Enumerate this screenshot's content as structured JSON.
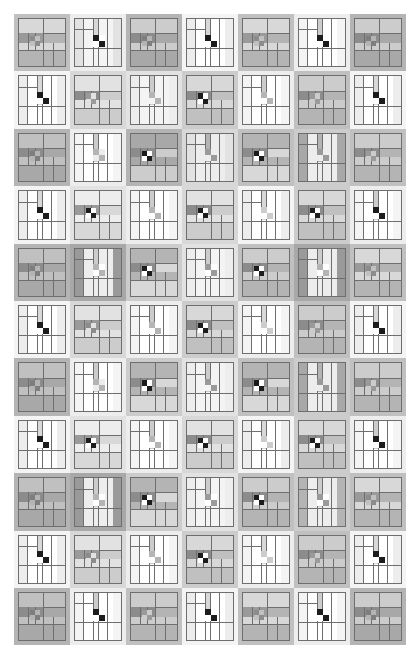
{
  "artwork": {
    "title": "Abstract Grayscale Quilt Grid",
    "description": "A rectangular grid of small abstract quilt blocks rendered in grayscale on a white background.",
    "background_color": "#ffffff",
    "grid": {
      "rows": 11,
      "columns": 7,
      "origin_x": 14,
      "origin_y": 14,
      "cell_width": 56,
      "cell_height": 57.4,
      "total_width": 392,
      "total_height": 631
    },
    "palette": {
      "white": "#ffffff",
      "near_white": "#f4f4f4",
      "light_1": "#ededed",
      "light_2": "#e2e2e2",
      "light_3": "#d8d8d8",
      "mid_1": "#cccccc",
      "mid_2": "#c0c0c0",
      "mid_3": "#b4b4b4",
      "mid_4": "#a8a8a8",
      "dark_1": "#9a9a9a",
      "dark_2": "#8c8c8c",
      "dark_3": "#7e7e7e",
      "very_dark": "#4a4a4a",
      "black": "#1c1c1c",
      "line": "#6e6e6e"
    },
    "block_types": {
      "A": "cross-bar block: horizontal banded interior with offset cross rails and a small 2x2 center",
      "B": "pinwheel block: vertical striped interior with a high-contrast 2x2 checkerboard center"
    },
    "cells": [
      {
        "r": 0,
        "c": 0,
        "type": "A",
        "bg": "#c0c0c0",
        "frame": "#d8d8d8",
        "field": "#b4b4b4",
        "accent": "#9a9a9a",
        "center": "#8c8c8c",
        "center_alt": "#c0c0c0"
      },
      {
        "r": 0,
        "c": 1,
        "type": "B",
        "bg": "#ededed",
        "frame": "#e2e2e2",
        "field": "#f4f4f4",
        "accent": "#d8d8d8",
        "center": "#1c1c1c",
        "center_alt": "#ffffff"
      },
      {
        "r": 0,
        "c": 2,
        "type": "A",
        "bg": "#b4b4b4",
        "frame": "#cccccc",
        "field": "#a8a8a8",
        "accent": "#8c8c8c",
        "center": "#7e7e7e",
        "center_alt": "#b4b4b4"
      },
      {
        "r": 0,
        "c": 3,
        "type": "B",
        "bg": "#f4f4f4",
        "frame": "#ededed",
        "field": "#ffffff",
        "accent": "#d8d8d8",
        "center": "#1c1c1c",
        "center_alt": "#ffffff"
      },
      {
        "r": 0,
        "c": 4,
        "type": "A",
        "bg": "#c0c0c0",
        "frame": "#d8d8d8",
        "field": "#b4b4b4",
        "accent": "#9a9a9a",
        "center": "#8c8c8c",
        "center_alt": "#c0c0c0"
      },
      {
        "r": 0,
        "c": 5,
        "type": "B",
        "bg": "#ededed",
        "frame": "#f4f4f4",
        "field": "#ffffff",
        "accent": "#cccccc",
        "center": "#1c1c1c",
        "center_alt": "#ffffff"
      },
      {
        "r": 0,
        "c": 6,
        "type": "A",
        "bg": "#b4b4b4",
        "frame": "#cccccc",
        "field": "#a8a8a8",
        "accent": "#8c8c8c",
        "center": "#7e7e7e",
        "center_alt": "#b4b4b4"
      },
      {
        "r": 1,
        "c": 0,
        "type": "B",
        "bg": "#f4f4f4",
        "frame": "#ededed",
        "field": "#ffffff",
        "accent": "#d8d8d8",
        "center": "#1c1c1c",
        "center_alt": "#ffffff"
      },
      {
        "r": 1,
        "c": 1,
        "type": "A",
        "bg": "#d8d8d8",
        "frame": "#e2e2e2",
        "field": "#cccccc",
        "accent": "#8c8c8c",
        "center": "#9a9a9a",
        "center_alt": "#e2e2e2"
      },
      {
        "r": 1,
        "c": 2,
        "type": "B",
        "bg": "#e2e2e2",
        "frame": "#ededed",
        "field": "#f4f4f4",
        "accent": "#cccccc",
        "center": "#b4b4b4",
        "center_alt": "#f4f4f4"
      },
      {
        "r": 1,
        "c": 3,
        "type": "A",
        "bg": "#cccccc",
        "frame": "#d8d8d8",
        "field": "#c0c0c0",
        "accent": "#8c8c8c",
        "center": "#1c1c1c",
        "center_alt": "#ffffff"
      },
      {
        "r": 1,
        "c": 4,
        "type": "B",
        "bg": "#ededed",
        "frame": "#f4f4f4",
        "field": "#ffffff",
        "accent": "#cccccc",
        "center": "#b4b4b4",
        "center_alt": "#ffffff"
      },
      {
        "r": 1,
        "c": 5,
        "type": "A",
        "bg": "#c0c0c0",
        "frame": "#cccccc",
        "field": "#b4b4b4",
        "accent": "#8c8c8c",
        "center": "#9a9a9a",
        "center_alt": "#cccccc"
      },
      {
        "r": 1,
        "c": 6,
        "type": "B",
        "bg": "#f4f4f4",
        "frame": "#ededed",
        "field": "#ffffff",
        "accent": "#d8d8d8",
        "center": "#1c1c1c",
        "center_alt": "#ffffff"
      },
      {
        "r": 2,
        "c": 0,
        "type": "A",
        "bg": "#b4b4b4",
        "frame": "#c0c0c0",
        "field": "#a8a8a8",
        "accent": "#8c8c8c",
        "center": "#7e7e7e",
        "center_alt": "#b4b4b4"
      },
      {
        "r": 2,
        "c": 1,
        "type": "B",
        "bg": "#ededed",
        "frame": "#f4f4f4",
        "field": "#ffffff",
        "accent": "#cccccc",
        "center": "#b4b4b4",
        "center_alt": "#ededed"
      },
      {
        "r": 2,
        "c": 2,
        "type": "A",
        "bg": "#b4b4b4",
        "frame": "#a8a8a8",
        "field": "#cccccc",
        "accent": "#8c8c8c",
        "center": "#1c1c1c",
        "center_alt": "#ffffff"
      },
      {
        "r": 2,
        "c": 3,
        "type": "B",
        "bg": "#d8d8d8",
        "frame": "#e2e2e2",
        "field": "#ededed",
        "accent": "#b4b4b4",
        "center": "#9a9a9a",
        "center_alt": "#ededed"
      },
      {
        "r": 2,
        "c": 4,
        "type": "A",
        "bg": "#c0c0c0",
        "frame": "#b4b4b4",
        "field": "#d8d8d8",
        "accent": "#8c8c8c",
        "center": "#1c1c1c",
        "center_alt": "#ffffff"
      },
      {
        "r": 2,
        "c": 5,
        "type": "B",
        "bg": "#cccccc",
        "frame": "#a8a8a8",
        "field": "#ededed",
        "accent": "#b4b4b4",
        "center": "#9a9a9a",
        "center_alt": "#ededed"
      },
      {
        "r": 2,
        "c": 6,
        "type": "A",
        "bg": "#c0c0c0",
        "frame": "#cccccc",
        "field": "#b4b4b4",
        "accent": "#8c8c8c",
        "center": "#9a9a9a",
        "center_alt": "#cccccc"
      },
      {
        "r": 3,
        "c": 0,
        "type": "B",
        "bg": "#f4f4f4",
        "frame": "#ededed",
        "field": "#ffffff",
        "accent": "#d8d8d8",
        "center": "#1c1c1c",
        "center_alt": "#ffffff"
      },
      {
        "r": 3,
        "c": 1,
        "type": "A",
        "bg": "#e2e2e2",
        "frame": "#ededed",
        "field": "#d8d8d8",
        "accent": "#9a9a9a",
        "center": "#1c1c1c",
        "center_alt": "#ffffff"
      },
      {
        "r": 3,
        "c": 2,
        "type": "B",
        "bg": "#ededed",
        "frame": "#f4f4f4",
        "field": "#ffffff",
        "accent": "#cccccc",
        "center": "#b4b4b4",
        "center_alt": "#ffffff"
      },
      {
        "r": 3,
        "c": 3,
        "type": "A",
        "bg": "#d8d8d8",
        "frame": "#e2e2e2",
        "field": "#cccccc",
        "accent": "#8c8c8c",
        "center": "#1c1c1c",
        "center_alt": "#ffffff"
      },
      {
        "r": 3,
        "c": 4,
        "type": "B",
        "bg": "#f4f4f4",
        "frame": "#ededed",
        "field": "#ffffff",
        "accent": "#d8d8d8",
        "center": "#cccccc",
        "center_alt": "#ffffff"
      },
      {
        "r": 3,
        "c": 5,
        "type": "A",
        "bg": "#cccccc",
        "frame": "#d8d8d8",
        "field": "#c0c0c0",
        "accent": "#8c8c8c",
        "center": "#1c1c1c",
        "center_alt": "#ffffff"
      },
      {
        "r": 3,
        "c": 6,
        "type": "B",
        "bg": "#ededed",
        "frame": "#f4f4f4",
        "field": "#ffffff",
        "accent": "#cccccc",
        "center": "#1c1c1c",
        "center_alt": "#ffffff"
      },
      {
        "r": 4,
        "c": 0,
        "type": "A",
        "bg": "#b4b4b4",
        "frame": "#c0c0c0",
        "field": "#a8a8a8",
        "accent": "#8c8c8c",
        "center": "#7e7e7e",
        "center_alt": "#b4b4b4"
      },
      {
        "r": 4,
        "c": 1,
        "type": "B",
        "bg": "#a8a8a8",
        "frame": "#9a9a9a",
        "field": "#ededed",
        "accent": "#cccccc",
        "center": "#b4b4b4",
        "center_alt": "#ffffff"
      },
      {
        "r": 4,
        "c": 2,
        "type": "A",
        "bg": "#cccccc",
        "frame": "#b4b4b4",
        "field": "#d8d8d8",
        "accent": "#8c8c8c",
        "center": "#1c1c1c",
        "center_alt": "#ffffff"
      },
      {
        "r": 4,
        "c": 3,
        "type": "B",
        "bg": "#e2e2e2",
        "frame": "#ededed",
        "field": "#f4f4f4",
        "accent": "#cccccc",
        "center": "#9a9a9a",
        "center_alt": "#ffffff"
      },
      {
        "r": 4,
        "c": 4,
        "type": "A",
        "bg": "#c0c0c0",
        "frame": "#cccccc",
        "field": "#b4b4b4",
        "accent": "#8c8c8c",
        "center": "#1c1c1c",
        "center_alt": "#ffffff"
      },
      {
        "r": 4,
        "c": 5,
        "type": "B",
        "bg": "#a8a8a8",
        "frame": "#9a9a9a",
        "field": "#ededed",
        "accent": "#cccccc",
        "center": "#b4b4b4",
        "center_alt": "#ffffff"
      },
      {
        "r": 4,
        "c": 6,
        "type": "A",
        "bg": "#c0c0c0",
        "frame": "#d8d8d8",
        "field": "#b4b4b4",
        "accent": "#9a9a9a",
        "center": "#8c8c8c",
        "center_alt": "#c0c0c0"
      },
      {
        "r": 5,
        "c": 0,
        "type": "B",
        "bg": "#f4f4f4",
        "frame": "#ededed",
        "field": "#ffffff",
        "accent": "#d8d8d8",
        "center": "#1c1c1c",
        "center_alt": "#ffffff"
      },
      {
        "r": 5,
        "c": 1,
        "type": "A",
        "bg": "#d8d8d8",
        "frame": "#e2e2e2",
        "field": "#cccccc",
        "accent": "#9a9a9a",
        "center": "#8c8c8c",
        "center_alt": "#e2e2e2"
      },
      {
        "r": 5,
        "c": 2,
        "type": "B",
        "bg": "#ededed",
        "frame": "#f4f4f4",
        "field": "#ffffff",
        "accent": "#cccccc",
        "center": "#b4b4b4",
        "center_alt": "#ffffff"
      },
      {
        "r": 5,
        "c": 3,
        "type": "A",
        "bg": "#cccccc",
        "frame": "#d8d8d8",
        "field": "#c0c0c0",
        "accent": "#8c8c8c",
        "center": "#1c1c1c",
        "center_alt": "#ffffff"
      },
      {
        "r": 5,
        "c": 4,
        "type": "B",
        "bg": "#ededed",
        "frame": "#f4f4f4",
        "field": "#ffffff",
        "accent": "#d8d8d8",
        "center": "#cccccc",
        "center_alt": "#ffffff"
      },
      {
        "r": 5,
        "c": 5,
        "type": "A",
        "bg": "#c0c0c0",
        "frame": "#cccccc",
        "field": "#b4b4b4",
        "accent": "#8c8c8c",
        "center": "#9a9a9a",
        "center_alt": "#cccccc"
      },
      {
        "r": 5,
        "c": 6,
        "type": "B",
        "bg": "#f4f4f4",
        "frame": "#ededed",
        "field": "#ffffff",
        "accent": "#d8d8d8",
        "center": "#1c1c1c",
        "center_alt": "#ffffff"
      },
      {
        "r": 6,
        "c": 0,
        "type": "A",
        "bg": "#b4b4b4",
        "frame": "#c0c0c0",
        "field": "#a8a8a8",
        "accent": "#8c8c8c",
        "center": "#7e7e7e",
        "center_alt": "#b4b4b4"
      },
      {
        "r": 6,
        "c": 1,
        "type": "B",
        "bg": "#ededed",
        "frame": "#f4f4f4",
        "field": "#ffffff",
        "accent": "#cccccc",
        "center": "#b4b4b4",
        "center_alt": "#ededed"
      },
      {
        "r": 6,
        "c": 2,
        "type": "A",
        "bg": "#cccccc",
        "frame": "#b4b4b4",
        "field": "#d8d8d8",
        "accent": "#8c8c8c",
        "center": "#1c1c1c",
        "center_alt": "#ffffff"
      },
      {
        "r": 6,
        "c": 3,
        "type": "B",
        "bg": "#e2e2e2",
        "frame": "#ededed",
        "field": "#f4f4f4",
        "accent": "#cccccc",
        "center": "#9a9a9a",
        "center_alt": "#f4f4f4"
      },
      {
        "r": 6,
        "c": 4,
        "type": "A",
        "bg": "#c0c0c0",
        "frame": "#b4b4b4",
        "field": "#d8d8d8",
        "accent": "#8c8c8c",
        "center": "#1c1c1c",
        "center_alt": "#ffffff"
      },
      {
        "r": 6,
        "c": 5,
        "type": "B",
        "bg": "#cccccc",
        "frame": "#a8a8a8",
        "field": "#ededed",
        "accent": "#b4b4b4",
        "center": "#9a9a9a",
        "center_alt": "#ededed"
      },
      {
        "r": 6,
        "c": 6,
        "type": "A",
        "bg": "#c0c0c0",
        "frame": "#cccccc",
        "field": "#b4b4b4",
        "accent": "#8c8c8c",
        "center": "#9a9a9a",
        "center_alt": "#cccccc"
      },
      {
        "r": 7,
        "c": 0,
        "type": "B",
        "bg": "#f4f4f4",
        "frame": "#ededed",
        "field": "#ffffff",
        "accent": "#d8d8d8",
        "center": "#1c1c1c",
        "center_alt": "#ffffff"
      },
      {
        "r": 7,
        "c": 1,
        "type": "A",
        "bg": "#e2e2e2",
        "frame": "#ededed",
        "field": "#d8d8d8",
        "accent": "#9a9a9a",
        "center": "#1c1c1c",
        "center_alt": "#ffffff"
      },
      {
        "r": 7,
        "c": 2,
        "type": "B",
        "bg": "#ededed",
        "frame": "#f4f4f4",
        "field": "#ffffff",
        "accent": "#cccccc",
        "center": "#b4b4b4",
        "center_alt": "#ffffff"
      },
      {
        "r": 7,
        "c": 3,
        "type": "A",
        "bg": "#d8d8d8",
        "frame": "#e2e2e2",
        "field": "#cccccc",
        "accent": "#8c8c8c",
        "center": "#1c1c1c",
        "center_alt": "#ffffff"
      },
      {
        "r": 7,
        "c": 4,
        "type": "B",
        "bg": "#f4f4f4",
        "frame": "#ededed",
        "field": "#ffffff",
        "accent": "#d8d8d8",
        "center": "#cccccc",
        "center_alt": "#ffffff"
      },
      {
        "r": 7,
        "c": 5,
        "type": "A",
        "bg": "#cccccc",
        "frame": "#d8d8d8",
        "field": "#c0c0c0",
        "accent": "#8c8c8c",
        "center": "#1c1c1c",
        "center_alt": "#ffffff"
      },
      {
        "r": 7,
        "c": 6,
        "type": "B",
        "bg": "#ededed",
        "frame": "#f4f4f4",
        "field": "#ffffff",
        "accent": "#cccccc",
        "center": "#1c1c1c",
        "center_alt": "#ffffff"
      },
      {
        "r": 8,
        "c": 0,
        "type": "A",
        "bg": "#b4b4b4",
        "frame": "#c0c0c0",
        "field": "#a8a8a8",
        "accent": "#8c8c8c",
        "center": "#7e7e7e",
        "center_alt": "#b4b4b4"
      },
      {
        "r": 8,
        "c": 1,
        "type": "B",
        "bg": "#a8a8a8",
        "frame": "#9a9a9a",
        "field": "#ededed",
        "accent": "#cccccc",
        "center": "#b4b4b4",
        "center_alt": "#ffffff"
      },
      {
        "r": 8,
        "c": 2,
        "type": "A",
        "bg": "#cccccc",
        "frame": "#b4b4b4",
        "field": "#d8d8d8",
        "accent": "#8c8c8c",
        "center": "#1c1c1c",
        "center_alt": "#ffffff"
      },
      {
        "r": 8,
        "c": 3,
        "type": "B",
        "bg": "#e2e2e2",
        "frame": "#ededed",
        "field": "#f4f4f4",
        "accent": "#cccccc",
        "center": "#9a9a9a",
        "center_alt": "#ffffff"
      },
      {
        "r": 8,
        "c": 4,
        "type": "A",
        "bg": "#c0c0c0",
        "frame": "#cccccc",
        "field": "#b4b4b4",
        "accent": "#8c8c8c",
        "center": "#1c1c1c",
        "center_alt": "#ffffff"
      },
      {
        "r": 8,
        "c": 5,
        "type": "B",
        "bg": "#cccccc",
        "frame": "#b4b4b4",
        "field": "#ededed",
        "accent": "#cccccc",
        "center": "#9a9a9a",
        "center_alt": "#ffffff"
      },
      {
        "r": 8,
        "c": 6,
        "type": "A",
        "bg": "#c0c0c0",
        "frame": "#d8d8d8",
        "field": "#b4b4b4",
        "accent": "#9a9a9a",
        "center": "#8c8c8c",
        "center_alt": "#c0c0c0"
      },
      {
        "r": 9,
        "c": 0,
        "type": "B",
        "bg": "#f4f4f4",
        "frame": "#ededed",
        "field": "#ffffff",
        "accent": "#d8d8d8",
        "center": "#1c1c1c",
        "center_alt": "#ffffff"
      },
      {
        "r": 9,
        "c": 1,
        "type": "A",
        "bg": "#d8d8d8",
        "frame": "#e2e2e2",
        "field": "#cccccc",
        "accent": "#9a9a9a",
        "center": "#8c8c8c",
        "center_alt": "#e2e2e2"
      },
      {
        "r": 9,
        "c": 2,
        "type": "B",
        "bg": "#ededed",
        "frame": "#f4f4f4",
        "field": "#ffffff",
        "accent": "#cccccc",
        "center": "#b4b4b4",
        "center_alt": "#ffffff"
      },
      {
        "r": 9,
        "c": 3,
        "type": "A",
        "bg": "#cccccc",
        "frame": "#d8d8d8",
        "field": "#c0c0c0",
        "accent": "#8c8c8c",
        "center": "#1c1c1c",
        "center_alt": "#ffffff"
      },
      {
        "r": 9,
        "c": 4,
        "type": "B",
        "bg": "#ededed",
        "frame": "#f4f4f4",
        "field": "#ffffff",
        "accent": "#d8d8d8",
        "center": "#cccccc",
        "center_alt": "#ffffff"
      },
      {
        "r": 9,
        "c": 5,
        "type": "A",
        "bg": "#c0c0c0",
        "frame": "#cccccc",
        "field": "#b4b4b4",
        "accent": "#8c8c8c",
        "center": "#9a9a9a",
        "center_alt": "#cccccc"
      },
      {
        "r": 9,
        "c": 6,
        "type": "B",
        "bg": "#f4f4f4",
        "frame": "#ededed",
        "field": "#ffffff",
        "accent": "#d8d8d8",
        "center": "#1c1c1c",
        "center_alt": "#ffffff"
      },
      {
        "r": 10,
        "c": 0,
        "type": "A",
        "bg": "#b4b4b4",
        "frame": "#c0c0c0",
        "field": "#a8a8a8",
        "accent": "#8c8c8c",
        "center": "#7e7e7e",
        "center_alt": "#b4b4b4"
      },
      {
        "r": 10,
        "c": 1,
        "type": "B",
        "bg": "#ededed",
        "frame": "#f4f4f4",
        "field": "#ffffff",
        "accent": "#cccccc",
        "center": "#1c1c1c",
        "center_alt": "#ffffff"
      },
      {
        "r": 10,
        "c": 2,
        "type": "A",
        "bg": "#c0c0c0",
        "frame": "#cccccc",
        "field": "#b4b4b4",
        "accent": "#8c8c8c",
        "center": "#9a9a9a",
        "center_alt": "#cccccc"
      },
      {
        "r": 10,
        "c": 3,
        "type": "B",
        "bg": "#f4f4f4",
        "frame": "#ededed",
        "field": "#ffffff",
        "accent": "#d8d8d8",
        "center": "#1c1c1c",
        "center_alt": "#ffffff"
      },
      {
        "r": 10,
        "c": 4,
        "type": "A",
        "bg": "#c0c0c0",
        "frame": "#d8d8d8",
        "field": "#b4b4b4",
        "accent": "#9a9a9a",
        "center": "#8c8c8c",
        "center_alt": "#c0c0c0"
      },
      {
        "r": 10,
        "c": 5,
        "type": "B",
        "bg": "#ededed",
        "frame": "#f4f4f4",
        "field": "#ffffff",
        "accent": "#cccccc",
        "center": "#1c1c1c",
        "center_alt": "#ffffff"
      },
      {
        "r": 10,
        "c": 6,
        "type": "A",
        "bg": "#b4b4b4",
        "frame": "#cccccc",
        "field": "#a8a8a8",
        "accent": "#8c8c8c",
        "center": "#7e7e7e",
        "center_alt": "#b4b4b4"
      }
    ]
  }
}
